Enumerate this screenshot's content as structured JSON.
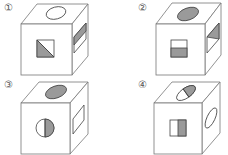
{
  "colors": {
    "shade": "#9a9a9a",
    "line": "#777777",
    "mark_line": "#444444"
  },
  "options": [
    {
      "label": "①",
      "top": "oval (white)",
      "front": "square split diagonally, lower-left shaded",
      "right": "rectangle with shaded upper part"
    },
    {
      "label": "②",
      "top": "oval (shaded)",
      "front": "square split horizontally, bottom shaded",
      "right": "rectangle split diagonally, upper triangle shaded"
    },
    {
      "label": "③",
      "top": "oval (shaded)",
      "front": "circle split vertically, right half shaded",
      "right": "rectangle (white)"
    },
    {
      "label": "④",
      "top": "oval split, right half shaded",
      "front": "square split vertically, right half shaded",
      "right": "oval (white)"
    }
  ]
}
